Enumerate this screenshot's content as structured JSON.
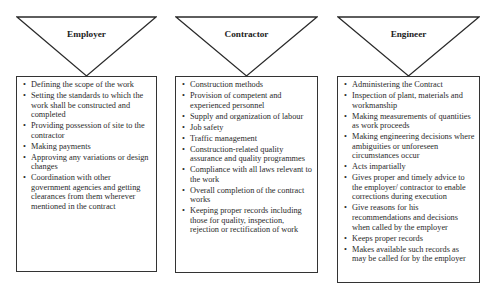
{
  "columns": [
    {
      "title": "Employer",
      "items": [
        "Defining the scope of the work",
        "Setting the standards to which the work shall be constructed and completed",
        "Providing possession of site to the contractor",
        "Making payments",
        "Approving any variations or design changes",
        "Coordination with other government agencies and getting clearances from them wherever mentioned in the contract"
      ]
    },
    {
      "title": "Contractor",
      "items": [
        "Construction methods",
        "Provision of competent and experienced personnel",
        "Supply and organization of labour",
        "Job safety",
        "Traffic management",
        "Construction-related quality assurance and quality programmes",
        "Compliance with all laws relevant to the work",
        "Overall completion of the contract works",
        "Keeping proper records including those for quality, inspection, rejection or rectification of work"
      ]
    },
    {
      "title": "Engineer",
      "items": [
        "Administering the Contract",
        "Inspection of plant, materials and workmanship",
        "Making measurements of quantities as work proceeds",
        "Making engineering decisions where ambiguities or unforeseen circumstances occur",
        "Acts impartially",
        "Gives proper and timely advice to the employer/ contractor to enable corrections during execution",
        "Give reasons for his recommendations and decisions when called by the employer",
        "Keeps proper records",
        "Makes available such records as may be called for by the employer"
      ]
    }
  ],
  "bullet_glyph": "•"
}
